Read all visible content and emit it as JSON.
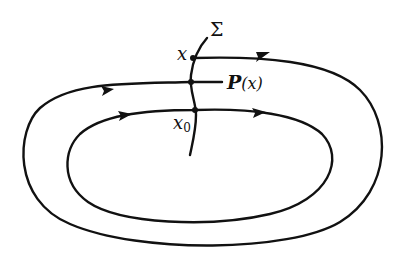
{
  "figure": {
    "labels": {
      "section": "Σ",
      "point": "x",
      "return_map_name": "P",
      "return_map_arg": "(x)",
      "fixed_point_base": "x",
      "fixed_point_sub": "0"
    },
    "colors": {
      "stroke": "#111111",
      "background": "#ffffff"
    }
  }
}
